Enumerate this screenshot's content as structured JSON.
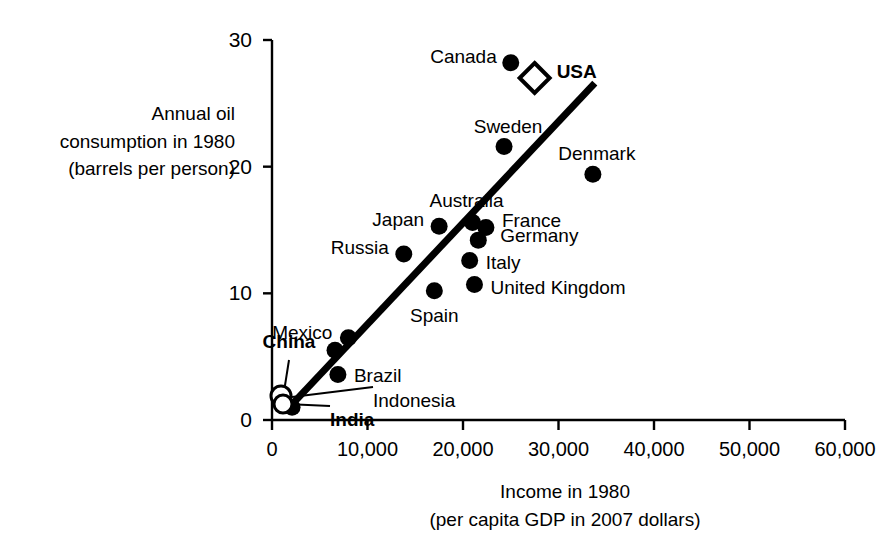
{
  "chart_data": {
    "type": "scatter",
    "title": "",
    "xlabel": "Income in 1980",
    "xlabel_sub": "(per capita GDP in 2007 dollars)",
    "ylabel_lines": [
      "Annual oil",
      "consumption in 1980",
      "(barrels per person)"
    ],
    "xlim": [
      0,
      60000
    ],
    "ylim": [
      0,
      30
    ],
    "xticks": [
      0,
      10000,
      20000,
      30000,
      40000,
      50000,
      60000
    ],
    "xtick_labels": [
      "0",
      "10,000",
      "20,000",
      "30,000",
      "40,000",
      "50,000",
      "60,000"
    ],
    "yticks": [
      0,
      10,
      20,
      30
    ],
    "ytick_labels": [
      "0",
      "10",
      "20",
      "30"
    ],
    "grid": false,
    "legend": false,
    "marker_color": "#000000",
    "points": [
      {
        "name": "USA",
        "x": 27500,
        "y": 27.0,
        "marker": "diamond-open",
        "label_bold": true,
        "label_dx": 22,
        "label_dy": -7,
        "label_align": "left"
      },
      {
        "name": "Canada",
        "x": 25000,
        "y": 28.2,
        "marker": "circle",
        "label_bold": false,
        "label_dx": -14,
        "label_dy": -7,
        "label_align": "right"
      },
      {
        "name": "Sweden",
        "x": 24300,
        "y": 21.6,
        "marker": "circle",
        "label_bold": false,
        "label_dx": 4,
        "label_dy": -20,
        "label_align": "center"
      },
      {
        "name": "Denmark",
        "x": 33600,
        "y": 19.4,
        "marker": "circle",
        "label_bold": false,
        "label_dx": 4,
        "label_dy": -21,
        "label_align": "center"
      },
      {
        "name": "Australia",
        "x": 21000,
        "y": 15.6,
        "marker": "circle",
        "label_bold": false,
        "label_dx": -6,
        "label_dy": -22,
        "label_align": "center"
      },
      {
        "name": "Japan",
        "x": 17500,
        "y": 15.3,
        "marker": "circle",
        "label_bold": false,
        "label_dx": -15,
        "label_dy": -7,
        "label_align": "right"
      },
      {
        "name": "France",
        "x": 22400,
        "y": 15.2,
        "marker": "circle",
        "label_bold": false,
        "label_dx": 16,
        "label_dy": -7,
        "label_align": "left"
      },
      {
        "name": "Germany",
        "x": 21600,
        "y": 14.2,
        "marker": "circle",
        "label_bold": false,
        "label_dx": 22,
        "label_dy": -5,
        "label_align": "left"
      },
      {
        "name": "Russia",
        "x": 13800,
        "y": 13.1,
        "marker": "circle",
        "label_bold": false,
        "label_dx": -15,
        "label_dy": -7,
        "label_align": "right"
      },
      {
        "name": "Italy",
        "x": 20700,
        "y": 12.6,
        "marker": "circle",
        "label_bold": false,
        "label_dx": 16,
        "label_dy": 2,
        "label_align": "left"
      },
      {
        "name": "United Kingdom",
        "x": 21200,
        "y": 10.7,
        "marker": "circle",
        "label_bold": false,
        "label_dx": 16,
        "label_dy": 3,
        "label_align": "left"
      },
      {
        "name": "Spain",
        "x": 17000,
        "y": 10.2,
        "marker": "circle",
        "label_bold": false,
        "label_dx": 0,
        "label_dy": 24,
        "label_align": "center"
      },
      {
        "name": "Mexico",
        "x": 8000,
        "y": 6.5,
        "marker": "circle",
        "label_bold": false,
        "label_dx": -16,
        "label_dy": -6,
        "label_align": "right"
      },
      {
        "name": "China",
        "x": 6600,
        "y": 5.5,
        "marker": "circle",
        "label_bold": false,
        "label_dx": 0,
        "label_dy": 0,
        "label_align": "none"
      },
      {
        "name": "Brazil",
        "x": 6900,
        "y": 3.6,
        "marker": "circle",
        "label_bold": false,
        "label_dx": 16,
        "label_dy": 1,
        "label_align": "left"
      },
      {
        "name": "Indonesia",
        "x": 2100,
        "y": 1.0,
        "marker": "circle",
        "label_bold": false,
        "label_dx": 0,
        "label_dy": 0,
        "label_align": "none"
      }
    ],
    "leader_labels": [
      {
        "name": "China",
        "text": "China",
        "bold": true,
        "lx": 289,
        "ly": 354,
        "align": "center",
        "px": 283,
        "py": 398
      },
      {
        "name": "India",
        "text": "India",
        "bold": true,
        "lx": 330,
        "ly": 420,
        "align": "left",
        "px": 286,
        "py": 404
      },
      {
        "name": "Indonesia",
        "text": "Indonesia",
        "bold": false,
        "lx": 373,
        "ly": 401,
        "align": "left",
        "px": 292,
        "py": 397
      }
    ],
    "open_markers": [
      {
        "name": "China-open",
        "cx": 281,
        "cy": 396,
        "r": 10
      },
      {
        "name": "India-open",
        "cx": 283,
        "cy": 404,
        "r": 9
      }
    ],
    "trendline": {
      "x0": 1800,
      "y0": 1.0,
      "x1": 33800,
      "y1": 26.6,
      "width": 7
    }
  }
}
